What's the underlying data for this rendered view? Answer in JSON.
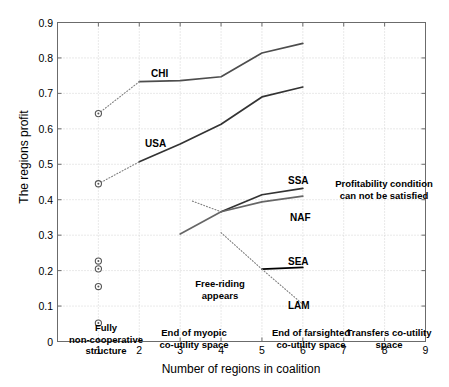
{
  "chart_data": {
    "type": "line",
    "title": "",
    "xlabel": "Number of regions in coalition",
    "ylabel": "The regions profit",
    "xlim": [
      0,
      9
    ],
    "ylim": [
      0,
      0.9
    ],
    "xticks": [
      "1",
      "2",
      "3",
      "4",
      "5",
      "6",
      "7",
      "8",
      "9"
    ],
    "yticks": [
      "0",
      "0.1",
      "0.2",
      "0.3",
      "0.4",
      "0.5",
      "0.6",
      "0.7",
      "0.8",
      "0.9"
    ],
    "grid": true,
    "legend_position": "inline-labels",
    "series": [
      {
        "name": "CHI",
        "style": "solid",
        "color": "#4d4d4d",
        "x": [
          2,
          3,
          4,
          5,
          6
        ],
        "values": [
          0.733,
          0.736,
          0.747,
          0.814,
          0.841
        ]
      },
      {
        "name": "CHI-dotted",
        "style": "dotted",
        "color": "#808080",
        "x": [
          1,
          2
        ],
        "values": [
          0.643,
          0.733
        ]
      },
      {
        "name": "USA",
        "style": "solid",
        "color": "#333333",
        "x": [
          2,
          3,
          4,
          5,
          6
        ],
        "values": [
          0.507,
          0.557,
          0.613,
          0.69,
          0.718
        ]
      },
      {
        "name": "USA-dotted",
        "style": "dotted",
        "color": "#808080",
        "x": [
          1,
          2
        ],
        "values": [
          0.445,
          0.507
        ]
      },
      {
        "name": "SSA",
        "style": "solid",
        "color": "#333333",
        "x": [
          4,
          5,
          6
        ],
        "values": [
          0.366,
          0.414,
          0.432
        ]
      },
      {
        "name": "SSA-dotted",
        "style": "dotted",
        "color": "#808080",
        "x": [
          3.3,
          4
        ],
        "values": [
          0.396,
          0.366
        ]
      },
      {
        "name": "NAF",
        "style": "solid",
        "color": "#666666",
        "x": [
          3,
          4,
          5,
          6
        ],
        "values": [
          0.303,
          0.366,
          0.394,
          0.41
        ]
      },
      {
        "name": "SEA",
        "style": "solid",
        "color": "#000000",
        "x": [
          5,
          6
        ],
        "values": [
          0.204,
          0.209
        ]
      },
      {
        "name": "SEA-dotted",
        "style": "dotted",
        "color": "#808080",
        "x": [
          4,
          5
        ],
        "values": [
          0.307,
          0.204
        ]
      },
      {
        "name": "LAM",
        "style": "dotted",
        "color": "#808080",
        "x": [
          5,
          6
        ],
        "values": [
          0.204,
          0.105
        ]
      }
    ],
    "markers": [
      {
        "x": 1,
        "y": 0.643,
        "shape": "circle-dot"
      },
      {
        "x": 1,
        "y": 0.445,
        "shape": "circle-dot"
      },
      {
        "x": 1,
        "y": 0.227,
        "shape": "circle-dot"
      },
      {
        "x": 1,
        "y": 0.205,
        "shape": "circle-dot"
      },
      {
        "x": 1,
        "y": 0.155,
        "shape": "circle-dot"
      },
      {
        "x": 1,
        "y": 0.052,
        "shape": "circle-dot"
      }
    ],
    "series_labels": [
      {
        "text": "CHI",
        "x": 151,
        "y": 68
      },
      {
        "text": "USA",
        "x": 145,
        "y": 138
      },
      {
        "text": "SSA",
        "x": 288,
        "y": 175
      },
      {
        "text": "NAF",
        "x": 290,
        "y": 212
      },
      {
        "text": "SEA",
        "x": 288,
        "y": 256
      },
      {
        "text": "LAM",
        "x": 288,
        "y": 300
      }
    ],
    "annotations": [
      {
        "text": "Profitability condition\ncan not be satisfied",
        "x": 384,
        "y": 178
      },
      {
        "text": "Free-riding\nappears",
        "x": 220,
        "y": 278
      },
      {
        "text": "Fully\nnon-cooperative\nstructure",
        "x": 106,
        "y": 322
      },
      {
        "text": "End of myopic\nco-utility space",
        "x": 194,
        "y": 327
      },
      {
        "text": "End of farsighted\nco-utility space",
        "x": 311,
        "y": 327
      },
      {
        "text": "Transfers co-utility\nspace",
        "x": 389,
        "y": 327
      }
    ]
  }
}
